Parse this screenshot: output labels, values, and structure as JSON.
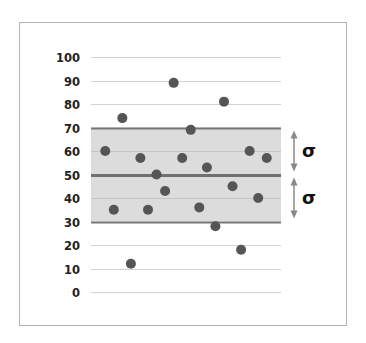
{
  "chart_data": {
    "type": "scatter",
    "title": "",
    "xlabel": "",
    "ylabel": "",
    "ylim": [
      0,
      100
    ],
    "yticks": [
      0,
      10,
      20,
      30,
      40,
      50,
      60,
      70,
      80,
      90,
      100
    ],
    "ytick_labels": [
      "0",
      "10",
      "20",
      "30",
      "40",
      "50",
      "60",
      "70",
      "80",
      "90",
      "100"
    ],
    "grid": true,
    "mean": 50,
    "std_dev": 20,
    "band": {
      "from": 30,
      "to": 70
    },
    "annotations": [
      {
        "label": "σ",
        "from": 50,
        "to": 70,
        "type": "double-arrow"
      },
      {
        "label": "σ",
        "from": 30,
        "to": 50,
        "type": "double-arrow"
      }
    ],
    "points": [
      {
        "x": 1,
        "y": 60
      },
      {
        "x": 2,
        "y": 35
      },
      {
        "x": 3,
        "y": 74
      },
      {
        "x": 4,
        "y": 12
      },
      {
        "x": 5,
        "y": 57
      },
      {
        "x": 6,
        "y": 35
      },
      {
        "x": 7,
        "y": 50
      },
      {
        "x": 8,
        "y": 43
      },
      {
        "x": 9,
        "y": 89
      },
      {
        "x": 10,
        "y": 57
      },
      {
        "x": 11,
        "y": 69
      },
      {
        "x": 12,
        "y": 36
      },
      {
        "x": 13,
        "y": 53
      },
      {
        "x": 14,
        "y": 28
      },
      {
        "x": 15,
        "y": 81
      },
      {
        "x": 16,
        "y": 45
      },
      {
        "x": 17,
        "y": 18
      },
      {
        "x": 18,
        "y": 60
      },
      {
        "x": 19,
        "y": 40
      },
      {
        "x": 20,
        "y": 57
      }
    ],
    "point_x_positions": [
      0.075,
      0.12,
      0.165,
      0.21,
      0.26,
      0.3,
      0.345,
      0.39,
      0.435,
      0.48,
      0.525,
      0.57,
      0.61,
      0.655,
      0.7,
      0.745,
      0.79,
      0.835,
      0.88,
      0.925
    ],
    "colors": {
      "points": "#555555",
      "band": "#dcdcdc",
      "mean_line": "#707070"
    }
  }
}
